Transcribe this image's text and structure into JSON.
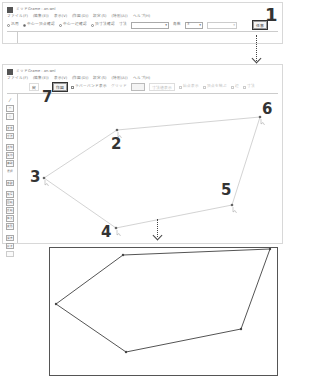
{
  "window1": {
    "title": "ミッドGrame - an.wnl",
    "menu": [
      "ファイル(F)",
      "(編集(E))",
      "表示(V)",
      "(作図(D))",
      "設定(S)",
      "(特別(A))",
      "ヘルプ(H)"
    ],
    "toolbar": {
      "radio_options": [
        {
          "label": "汎用",
          "checked": false
        },
        {
          "label": "中心一頂点確認",
          "checked": true
        },
        {
          "label": "中心一辺確認",
          "checked": false
        },
        {
          "label": "頂寸法確認",
          "checked": false
        }
      ],
      "size_label": "寸法",
      "size_value": "",
      "angle_label": "角数",
      "angle_value": "3",
      "extra_combo_value": "",
      "extra_label": "",
      "apply_button": "任意"
    }
  },
  "window2": {
    "title": "ミッドGrame - an.wnl",
    "menu": [
      "ファイル(F)",
      "(編集(E))",
      "表示(V)",
      "(作図(D))",
      "設定(S)",
      "(特別(A))",
      "ヘルプ(H)"
    ],
    "toolbar": {
      "cancel_button": "戻",
      "finish_button": "作図",
      "checkbox_auto": "ラバーバンド表示",
      "snap_label": "グリッド",
      "size_box": "",
      "options": [
        "寸法値表示",
        "始点表示",
        "頂点を結ぶ",
        "辺",
        "寸法"
      ]
    },
    "sidebar": {
      "tools": [
        "線",
        "四角",
        "円",
        "文字",
        "寸法",
        "点線",
        "矢印",
        "補助",
        "選択",
        "移動",
        "複写",
        "回転",
        "反転",
        "拡大",
        "変形",
        "消去",
        "戻す"
      ]
    }
  },
  "callouts": {
    "step1": "1",
    "step2": "2",
    "step3": "3",
    "step4": "4",
    "step5": "5",
    "step6": "6",
    "step7": "7"
  },
  "polygon_points": {
    "p2": [
      117,
      130
    ],
    "p3": [
      44,
      178
    ],
    "p4": [
      116,
      228
    ],
    "p5": [
      232,
      205
    ],
    "p6": [
      260,
      117
    ]
  },
  "result_polygon": [
    [
      129,
      28
    ],
    [
      6,
      93
    ],
    [
      109,
      168
    ],
    [
      262,
      139
    ],
    [
      230,
      8
    ]
  ],
  "colors": {
    "line": "#555555",
    "border": "#cccccc",
    "text_dark": "#333333"
  }
}
